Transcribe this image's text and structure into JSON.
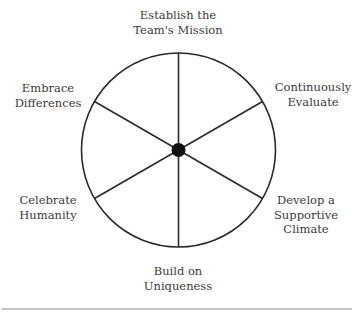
{
  "diagram": {
    "type": "wheel",
    "segments": 6,
    "center": "hub",
    "colors": {
      "stroke": "#2a2a2a",
      "text": "#3a3a3a",
      "rule": "#888888"
    },
    "labels": {
      "top": {
        "line1": "Establish the",
        "line2": "Team's Mission"
      },
      "upper_right": {
        "line1": "Continuously",
        "line2": "Evaluate"
      },
      "lower_right": {
        "line1": "Develop a",
        "line2": "Supportive",
        "line3": "Climate"
      },
      "bottom": {
        "line1": "Build on",
        "line2": "Uniqueness"
      },
      "lower_left": {
        "line1": "Celebrate",
        "line2": "Humanity"
      },
      "upper_left": {
        "line1": "Embrace",
        "line2": "Differences"
      }
    }
  }
}
